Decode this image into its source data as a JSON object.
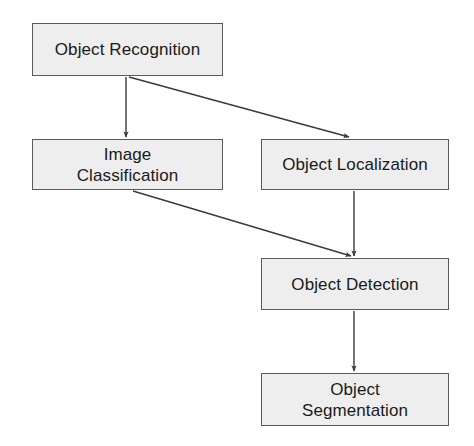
{
  "diagram": {
    "type": "flowchart",
    "background_color": "#ffffff",
    "node_fill_color": "#eeeeee",
    "node_border_color": "#5a5a5a",
    "edge_color": "#3a3a3a",
    "text_color": "#1a1a1a",
    "nodes": [
      {
        "id": "object-recognition",
        "label": "Object Recognition",
        "x": 32,
        "y": 23,
        "width": 191,
        "height": 53
      },
      {
        "id": "image-classification",
        "label": "Image\nClassification",
        "x": 32,
        "y": 139,
        "width": 191,
        "height": 51
      },
      {
        "id": "object-localization",
        "label": "Object Localization",
        "x": 261,
        "y": 139,
        "width": 188,
        "height": 51
      },
      {
        "id": "object-detection",
        "label": "Object Detection",
        "x": 261,
        "y": 258,
        "width": 188,
        "height": 52
      },
      {
        "id": "object-segmentation",
        "label": "Object\nSegmentation",
        "x": 261,
        "y": 373,
        "width": 188,
        "height": 53
      }
    ],
    "edges": [
      {
        "id": "edge-recognition-to-classification",
        "from": "object-recognition",
        "to": "image-classification",
        "x1": 126,
        "y1": 77,
        "x2": 126,
        "y2": 137
      },
      {
        "id": "edge-recognition-to-localization",
        "from": "object-recognition",
        "to": "object-localization",
        "x1": 129,
        "y1": 77,
        "x2": 349,
        "y2": 137
      },
      {
        "id": "edge-classification-to-detection",
        "from": "image-classification",
        "to": "object-detection",
        "x1": 133,
        "y1": 191,
        "x2": 351,
        "y2": 256
      },
      {
        "id": "edge-localization-to-detection",
        "from": "object-localization",
        "to": "object-detection",
        "x1": 354,
        "y1": 191,
        "x2": 354,
        "y2": 256
      },
      {
        "id": "edge-detection-to-segmentation",
        "from": "object-detection",
        "to": "object-segmentation",
        "x1": 354,
        "y1": 311,
        "x2": 354,
        "y2": 371
      }
    ]
  }
}
